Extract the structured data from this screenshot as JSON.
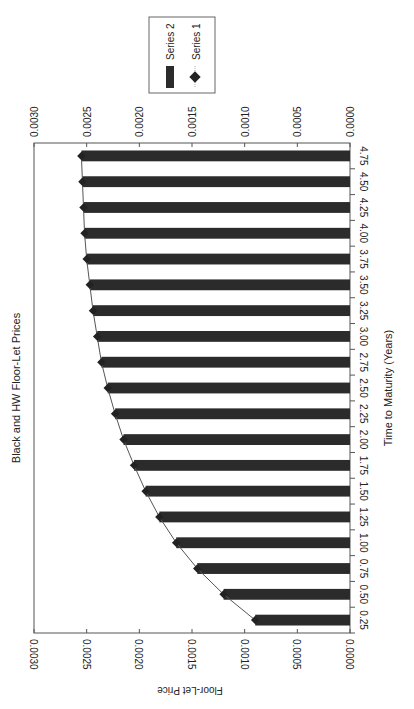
{
  "chart_data": {
    "type": "bar",
    "orientation": "horizontal (rotated page, bars grow right-to-left)",
    "title": "Black and HW Floor-Let Prices",
    "xlabel": "Time to Maturity (Years)",
    "ylabel": "Floor-Let Price",
    "categories": [
      "0.25",
      "0.50",
      "0.75",
      "1.00",
      "1.25",
      "1.50",
      "1.75",
      "2.00",
      "2.25",
      "2.50",
      "2.75",
      "3.00",
      "3.25",
      "3.50",
      "3.75",
      "4.00",
      "4.25",
      "4.50",
      "4.75"
    ],
    "series": [
      {
        "name": "Series 2",
        "kind": "bar",
        "color": "#2b2b2b",
        "values": [
          0.0009,
          0.0012,
          0.00145,
          0.00165,
          0.00181,
          0.00194,
          0.00205,
          0.00215,
          0.00223,
          0.0023,
          0.00236,
          0.0024,
          0.00244,
          0.00247,
          0.0025,
          0.00252,
          0.00253,
          0.00254,
          0.00255
        ]
      },
      {
        "name": "Series 1",
        "kind": "line-marker",
        "marker": "diamond",
        "color": "#333333",
        "values": [
          0.0009,
          0.0012,
          0.00145,
          0.00165,
          0.00181,
          0.00194,
          0.00205,
          0.00215,
          0.00223,
          0.0023,
          0.00236,
          0.0024,
          0.00244,
          0.00247,
          0.0025,
          0.00252,
          0.00253,
          0.00254,
          0.00255
        ]
      }
    ],
    "value_ticks": [
      "0.0000",
      "0.0005",
      "0.0010",
      "0.0015",
      "0.0020",
      "0.0025",
      "0.0030"
    ],
    "ylim": [
      0,
      0.003
    ],
    "grid": false,
    "legend_position": "top-right (rotated)"
  },
  "legend": {
    "items": [
      {
        "label": "Series 2",
        "symbol": "bar"
      },
      {
        "label": "Series 1",
        "symbol": "diamond"
      }
    ]
  }
}
